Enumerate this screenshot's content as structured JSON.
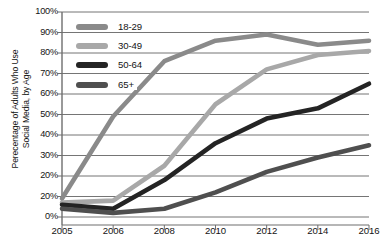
{
  "chart_data": {
    "type": "line",
    "title": "",
    "xlabel": "",
    "ylabel": "Perecentage of Adults Who Use\nSocial Media, by Age",
    "x": [
      2005,
      2006,
      2008,
      2010,
      2012,
      2014,
      2016
    ],
    "xtick_labels": [
      "2005",
      "2006",
      "2008",
      "2010",
      "2012",
      "2014",
      "2016"
    ],
    "ytick_labels": [
      "100%",
      "90%",
      "80%",
      "70%",
      "60%",
      "50%",
      "40%",
      "30%",
      "20%",
      "20%",
      "0%"
    ],
    "ytick_values": [
      100,
      90,
      80,
      70,
      60,
      50,
      40,
      30,
      20,
      10,
      0
    ],
    "ylim": [
      0,
      100
    ],
    "grid": "horizontal",
    "legend_position": "upper-left-inside",
    "series": [
      {
        "name": "18-29",
        "color": "#8a8a8a",
        "values": [
          9,
          49,
          76,
          86,
          89,
          84,
          86
        ]
      },
      {
        "name": "30-49",
        "color": "#a8a8a8",
        "values": [
          7,
          8,
          25,
          55,
          72,
          79,
          81
        ]
      },
      {
        "name": "50-64",
        "color": "#242424",
        "values": [
          6,
          4,
          18,
          36,
          48,
          53,
          65
        ]
      },
      {
        "name": "65+",
        "color": "#4f4f4f",
        "values": [
          4,
          2,
          4,
          12,
          22,
          29,
          35
        ]
      }
    ]
  },
  "legend": {
    "items": [
      {
        "label": "18-29",
        "color": "#8a8a8a"
      },
      {
        "label": "30-49",
        "color": "#a8a8a8"
      },
      {
        "label": "50-64",
        "color": "#242424"
      },
      {
        "label": "65+",
        "color": "#4f4f4f"
      }
    ]
  },
  "axes": {
    "axis_color": "#6e6e6e",
    "grid_color": "#757575"
  }
}
